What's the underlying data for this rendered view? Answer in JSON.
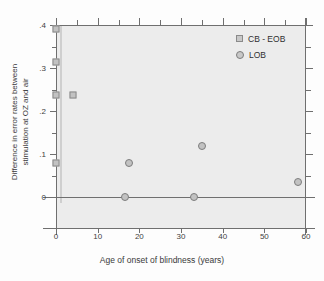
{
  "chart_data": {
    "type": "scatter",
    "title": "",
    "xlabel": "Age of onset of blindness (years)",
    "ylabel_line1": "Difference in error rates between",
    "ylabel_line2": "stimulation at OZ and air",
    "xlim": [
      0,
      60
    ],
    "ylim": [
      0,
      0.4
    ],
    "xticks": [
      0,
      10,
      20,
      30,
      40,
      50,
      60
    ],
    "xtick_labels": [
      "0",
      "10",
      "20",
      "30",
      "40",
      "50",
      "60"
    ],
    "xminor_ticks": [
      5,
      15,
      25,
      35,
      45,
      55
    ],
    "yticks": [
      0,
      0.1,
      0.2,
      0.3,
      0.4
    ],
    "ytick_labels": [
      "0",
      ".1",
      ".2",
      ".3",
      ".4"
    ],
    "yminor_ticks": [
      0.05,
      0.15,
      0.25,
      0.35
    ],
    "grid": false,
    "legend_position": "top-right",
    "zero_reference_line": 0,
    "series": [
      {
        "name": "CB - EOB",
        "marker": "square",
        "color": "#c2c2c2",
        "edge_color": "#8a8a8a",
        "points": [
          {
            "x": 0,
            "y": 0.39
          },
          {
            "x": 0,
            "y": 0.315
          },
          {
            "x": 0,
            "y": 0.238
          },
          {
            "x": 4,
            "y": 0.238
          },
          {
            "x": 0,
            "y": 0.08
          }
        ]
      },
      {
        "name": "LOB",
        "marker": "circle",
        "color": "#c2c2c2",
        "edge_color": "#7d7d7d",
        "points": [
          {
            "x": 16.5,
            "y": 0.0
          },
          {
            "x": 17.5,
            "y": 0.08
          },
          {
            "x": 33.0,
            "y": 0.0
          },
          {
            "x": 35.0,
            "y": 0.118
          },
          {
            "x": 58.0,
            "y": 0.035
          }
        ]
      }
    ]
  },
  "legend": {
    "entries": [
      {
        "label": "CB - EOB",
        "marker": "square"
      },
      {
        "label": "LOB",
        "marker": "circle"
      }
    ]
  }
}
